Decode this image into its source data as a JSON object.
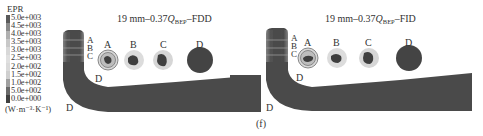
{
  "legend": {
    "title": "EPR",
    "values": [
      "5.0e+003",
      "4.5e+003",
      "4.0e+003",
      "3.5e+003",
      "3.0e+003",
      "2.5e+003",
      "2.0e+002",
      "1.5e+002",
      "1.0e+002",
      "5.0e+002",
      "0.0e+000"
    ],
    "unit": "(W·m⁻³·K⁻¹)",
    "colors": [
      "#555555",
      "#7a7a7a",
      "#9a9a9a",
      "#b5b5b5",
      "#c8c8c8",
      "#d6d6d6",
      "#dcdcdc",
      "#d2d2d2",
      "#aaaaaa",
      "#777777",
      "#444444"
    ]
  },
  "panels": [
    {
      "title_prefix": "19 mm–0.37",
      "title_q": "Q",
      "title_sub": "BEP",
      "title_suffix": "–FDD",
      "section_labels": [
        "A",
        "B",
        "C",
        "D"
      ],
      "pipe_labels": {
        "a": "A",
        "b": "B",
        "c": "C",
        "d_elbow": "D",
        "d_outlet": "D"
      }
    },
    {
      "title_prefix": "19 mm–0.37",
      "title_q": "Q",
      "title_sub": "BEP",
      "title_suffix": "–FID",
      "section_labels": [
        "A",
        "B",
        "C",
        "D"
      ],
      "pipe_labels": {
        "a": "A",
        "b": "B",
        "c": "C",
        "d_elbow": "D",
        "d_outlet": "D"
      }
    }
  ],
  "subfigure_label": "(f)",
  "colors": {
    "pipe": "#4a4a4a",
    "pipe_light": "#9c9c9c",
    "text": "#333333"
  }
}
